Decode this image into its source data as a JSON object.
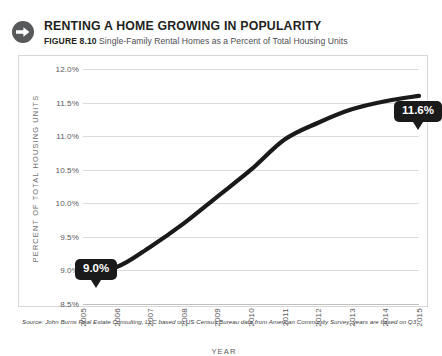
{
  "header": {
    "icon": "arrow-right-circle-icon",
    "title": "RENTING A HOME GROWING IN POPULARITY",
    "figure_label": "FIGURE 8.10",
    "description": "Single-Family Rental Homes as a Percent of Total Housing Units"
  },
  "source_note": "Source: John Burns Real Estate Consulting, LLC based on US Census Bureau data from American Community Survey; years are based on Q3",
  "callouts": [
    {
      "name": "start-value",
      "text": "9.0%",
      "year": "2005",
      "value": 9.0
    },
    {
      "name": "end-value",
      "text": "11.6%",
      "year": "2015",
      "value": 11.6
    }
  ],
  "chart_data": {
    "type": "line",
    "title": "Single-Family Rental Homes as a Percent of Total Housing Units",
    "xlabel": "YEAR",
    "ylabel": "PERCENT OF TOTAL HOUSING UNITS",
    "categories": [
      "2005",
      "2006",
      "2007",
      "2008",
      "2009",
      "2010",
      "2011",
      "2012",
      "2013",
      "2014",
      "2015"
    ],
    "values": [
      9.0,
      9.05,
      9.35,
      9.7,
      10.1,
      10.5,
      10.95,
      11.2,
      11.4,
      11.52,
      11.6
    ],
    "series": [
      {
        "name": "Single-Family Rental Homes",
        "color": "#1a1a1a",
        "values": [
          9.0,
          9.05,
          9.35,
          9.7,
          10.1,
          10.5,
          10.95,
          11.2,
          11.4,
          11.52,
          11.6
        ]
      }
    ],
    "ylim": [
      8.5,
      12.0
    ],
    "ytick_labels": [
      "12.0%",
      "11.5%",
      "11.0%",
      "10.5%",
      "10.0%",
      "9.5%",
      "9.0%",
      "8.5%"
    ],
    "ytick_values": [
      12.0,
      11.5,
      11.0,
      10.5,
      10.0,
      9.5,
      9.0,
      8.5
    ],
    "grid": true,
    "legend": "none",
    "line_color": "#1a1a1a",
    "grid_color": "#dcdcdc"
  }
}
